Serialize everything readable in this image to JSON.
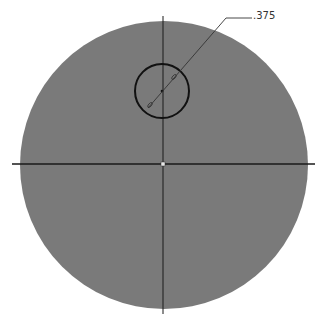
{
  "drawing": {
    "dimension_label": ".375",
    "colors": {
      "disk_fill": "#7a7a7a",
      "line": "#1a1a1a",
      "leader": "#333333",
      "background": "#ffffff"
    },
    "main_circle": {
      "cx": 164,
      "cy": 165,
      "r": 144
    },
    "hole_circle": {
      "cx": 162,
      "cy": 92,
      "r": 27
    },
    "center_marker": "square"
  }
}
